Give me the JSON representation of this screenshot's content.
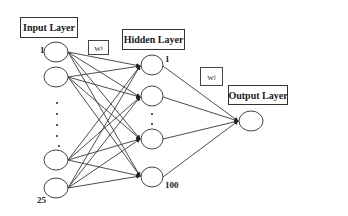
{
  "layers": {
    "input": {
      "label": "Input Layer",
      "first_index": "1",
      "last_index": "25",
      "visible_nodes": 4
    },
    "hidden": {
      "label": "Hidden Layer",
      "first_index": "1",
      "last_index": "100",
      "visible_nodes": 4
    },
    "output": {
      "label": "Output Layer",
      "visible_nodes": 1
    }
  },
  "weights": {
    "input_to_hidden": {
      "symbol": "W",
      "subscript": "i"
    },
    "hidden_to_output": {
      "symbol": "W",
      "subscript": "j"
    }
  },
  "colors": {
    "background": "#ffffff",
    "stroke": "#333333",
    "text": "#1a1a1a"
  }
}
